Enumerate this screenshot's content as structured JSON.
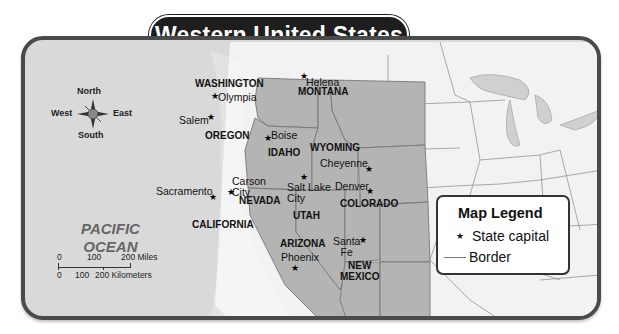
{
  "title": "Western United States",
  "compass": {
    "north": "North",
    "south": "South",
    "east": "East",
    "west": "West"
  },
  "ocean": {
    "line1": "PACIFIC",
    "line2": "OCEAN"
  },
  "states": {
    "washington": "WASHINGTON",
    "oregon": "OREGON",
    "california": "CALIFORNIA",
    "idaho": "IDAHO",
    "nevada": "NEVADA",
    "montana": "MONTANA",
    "wyoming": "WYOMING",
    "utah": "UTAH",
    "colorado": "COLORADO",
    "arizona": "ARIZONA",
    "new_mexico_1": "NEW",
    "new_mexico_2": "MEXICO"
  },
  "capitals": {
    "olympia": "Olympia",
    "salem": "Salem",
    "sacramento": "Sacramento",
    "boise": "Boise",
    "carson_city_1": "Carson",
    "carson_city_2": "City",
    "helena": "Helena",
    "cheyenne": "Cheyenne",
    "salt_lake_city_1": "Salt Lake",
    "salt_lake_city_2": "City",
    "denver": "Denver",
    "phoenix": "Phoenix",
    "santa_fe_1": "Santa",
    "santa_fe_2": "Fe"
  },
  "scale": {
    "miles_ticks": [
      "0",
      "100",
      "200 Miles"
    ],
    "km_ticks": [
      "0",
      "100",
      "200 Kilometers"
    ]
  },
  "legend": {
    "title": "Map Legend",
    "items": [
      {
        "symbol": "★",
        "label": "State capital"
      },
      {
        "symbol": "—",
        "label": "Border"
      }
    ]
  },
  "colors": {
    "highlighted_states": "#b4b4b4",
    "ocean": "#d9d9d9",
    "other_land": "#f2f2f2",
    "frame": "#4a4a4a",
    "title_bg": "#1e1e1e"
  }
}
